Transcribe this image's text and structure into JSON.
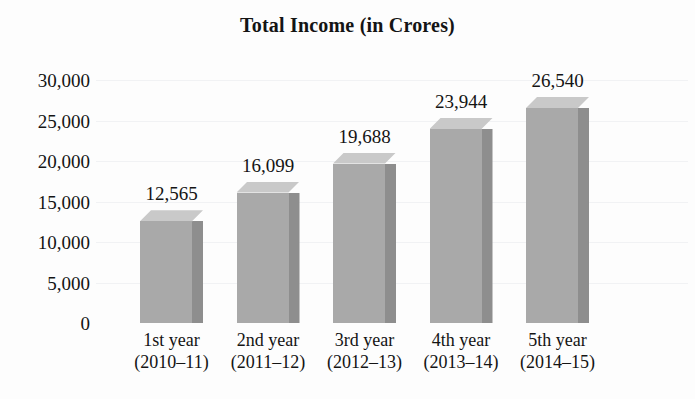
{
  "chart_data": {
    "type": "bar",
    "title": "Total Income (in Crores)",
    "xlabel": "",
    "ylabel": "",
    "categories": [
      "1st year",
      "2nd year",
      "3rd year",
      "4th year",
      "5th year"
    ],
    "category_sublabels": [
      "(2010–11)",
      "(2011–12)",
      "(2012–13)",
      "(2013–14)",
      "(2014–15)"
    ],
    "values": [
      12565,
      16099,
      19688,
      23944,
      26540
    ],
    "value_labels": [
      "12,565",
      "16,099",
      "19,688",
      "23,944",
      "26,540"
    ],
    "ylim": [
      0,
      30000
    ],
    "yticks": [
      0,
      5000,
      10000,
      15000,
      20000,
      25000,
      30000
    ],
    "ytick_labels": [
      "0",
      "5,000",
      "10,000",
      "15,000",
      "20,000",
      "25,000",
      "30,000"
    ],
    "grid": true,
    "legend": null,
    "style": {
      "bar_front_color": "#a9a9a9",
      "bar_side_color": "#8e8e8e",
      "bar_top_color": "#c9c9c9",
      "background_color": "#fdfdfd",
      "text_color": "#141414",
      "gridline_color": "#e8e9ec"
    }
  }
}
